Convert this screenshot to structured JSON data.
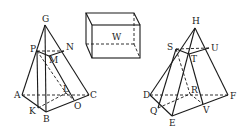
{
  "figures": [
    {
      "id": "left-pyramid",
      "labels": {
        "apex": "G",
        "P": "P",
        "N": "N",
        "M": "M",
        "A": "A",
        "C": "C",
        "B": "B",
        "K": "K",
        "L": "L",
        "O": "O"
      }
    },
    {
      "id": "box",
      "labels": {
        "face": "W"
      }
    },
    {
      "id": "right-pyramid",
      "labels": {
        "apex": "H",
        "S": "S",
        "U": "U",
        "T": "T",
        "D": "D",
        "F": "F",
        "E": "E",
        "Q": "Q",
        "R": "R",
        "V": "V"
      }
    }
  ],
  "colors": {
    "line": "#1a1a1a",
    "background": "#ffffff"
  }
}
